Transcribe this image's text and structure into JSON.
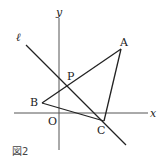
{
  "figure": {
    "caption": "図2",
    "axes": {
      "x_label": "x",
      "y_label": "y",
      "origin_label": "O"
    },
    "line_label": "ℓ",
    "points": {
      "A": {
        "label": "A",
        "px": [
          121,
          49
        ]
      },
      "B": {
        "label": "B",
        "px": [
          42,
          103
        ]
      },
      "C": {
        "label": "C",
        "px": [
          104,
          121
        ]
      },
      "P": {
        "label": "P",
        "px": [
          69,
          86
        ]
      }
    },
    "segments": [
      "AB",
      "BC",
      "CA"
    ],
    "line_l": {
      "from": [
        26,
        45
      ],
      "to": [
        126,
        145
      ]
    }
  }
}
